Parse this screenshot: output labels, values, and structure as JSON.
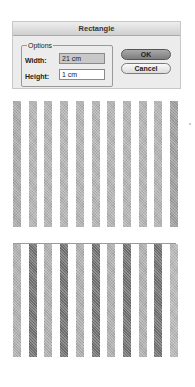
{
  "dialog": {
    "title": "Rectangle",
    "group_label": "Options",
    "width_label": "Width:",
    "width_value": "21 cm",
    "height_label": "Height:",
    "height_value": "1 cm",
    "ok_label": "OK",
    "cancel_label": "Cancel"
  },
  "preview_top": {
    "stripe_count": 11,
    "colors": [
      "#a9a9a9",
      "#b3b3b3",
      "#b3b3b3",
      "#b3b3b3",
      "#b3b3b3",
      "#b3b3b3",
      "#b3b3b3",
      "#b3b3b3",
      "#b3b3b3",
      "#b3b3b3",
      "#9e9e9e"
    ]
  },
  "preview_bottom": {
    "stripe_count": 11,
    "colors": [
      "#b0b0b0",
      "#707070",
      "#b0b0b0",
      "#707070",
      "#b0b0b0",
      "#707070",
      "#b0b0b0",
      "#707070",
      "#b0b0b0",
      "#707070",
      "#b8b8b8"
    ]
  }
}
